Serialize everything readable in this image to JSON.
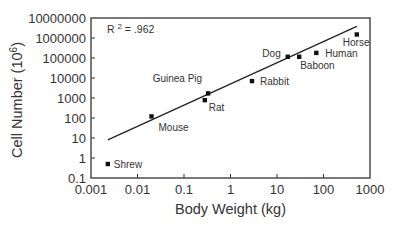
{
  "chart_data": {
    "type": "scatter",
    "title": "",
    "xlabel": "Body Weight (kg)",
    "ylabel": "Cell Number (10^6)",
    "ylabel_base": "Cell Number (10",
    "ylabel_exp": "6",
    "ylabel_close": ")",
    "xscale": "log",
    "yscale": "log",
    "xlim": [
      0.001,
      1000
    ],
    "ylim": [
      0.1,
      10000000
    ],
    "x_ticks": [
      "0.001",
      "0.01",
      "0.1",
      "1",
      "10",
      "100",
      "1000"
    ],
    "y_ticks": [
      "0.1",
      "1",
      "10",
      "100",
      "1000",
      "10000",
      "100000",
      "1000000",
      "10000000"
    ],
    "grid": false,
    "annotation": {
      "prefix": "R",
      "exp": "2",
      "suffix": " = .962",
      "text": "R² = .962"
    },
    "points": [
      {
        "label": "Shrew",
        "x": 0.0023,
        "y": 0.5
      },
      {
        "label": "Mouse",
        "x": 0.02,
        "y": 120
      },
      {
        "label": "Rat",
        "x": 0.28,
        "y": 780
      },
      {
        "label": "Guinea Pig",
        "x": 0.33,
        "y": 1700
      },
      {
        "label": "Rabbit",
        "x": 2.9,
        "y": 7000
      },
      {
        "label": "Dog",
        "x": 17,
        "y": 115000
      },
      {
        "label": "Baboon",
        "x": 30,
        "y": 115000
      },
      {
        "label": "Human",
        "x": 70,
        "y": 180000
      },
      {
        "label": "Horse",
        "x": 520,
        "y": 1500000
      }
    ],
    "regression_line": {
      "x": [
        0.0023,
        520
      ],
      "y": [
        8,
        3800000
      ]
    }
  },
  "colors": {
    "axis": "#333333",
    "marker": "#111111",
    "line": "#222222",
    "text": "#333333"
  }
}
